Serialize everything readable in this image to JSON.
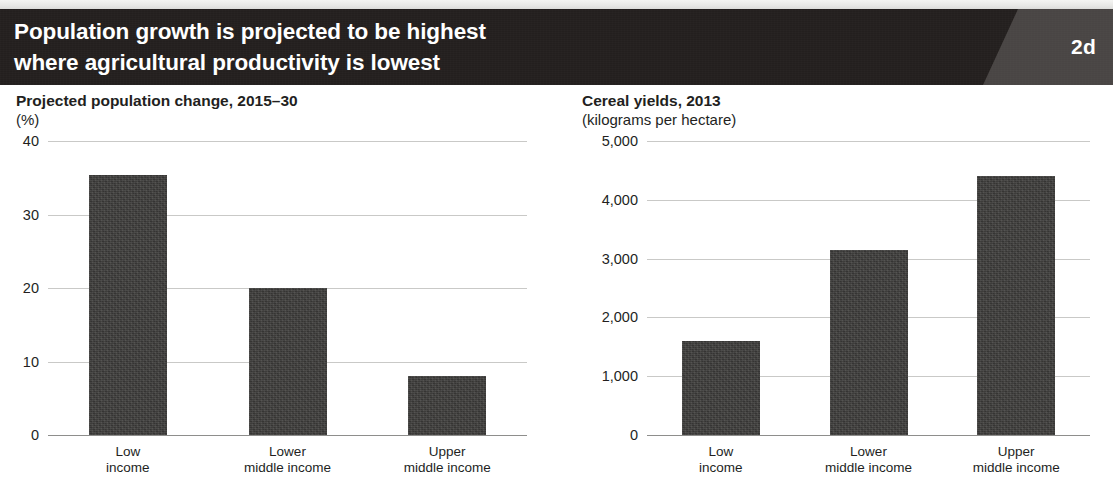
{
  "header": {
    "title_line1": "Population growth is projected to be highest",
    "title_line2": "where agricultural productivity is lowest",
    "badge": "2d",
    "banner_color": "#231f1e",
    "badge_panel_color": "#4a4644",
    "text_color": "#ffffff"
  },
  "theme": {
    "bar_color": "#3d3c3a",
    "gridline_color": "#c9c9c7",
    "axis_color": "#8e8e8c",
    "page_background": "#ffffff",
    "text_color": "#231f1e"
  },
  "chart_data": [
    {
      "id": "projected-population-change",
      "type": "bar",
      "title": "Projected population change, 2015–30",
      "subtitle": "(%)",
      "xlabel": "",
      "ylabel": "(%)",
      "categories": [
        "Low income",
        "Lower middle income",
        "Upper middle income"
      ],
      "category_lines": [
        [
          "Low",
          "income"
        ],
        [
          "Lower",
          "middle income"
        ],
        [
          "Upper",
          "middle income"
        ]
      ],
      "values": [
        35.4,
        20.0,
        8.0
      ],
      "ylim": [
        0,
        40
      ],
      "yticks": [
        0,
        10,
        20,
        30,
        40
      ],
      "ytick_labels": [
        "0",
        "10",
        "20",
        "30",
        "40"
      ],
      "grid": true,
      "legend": "none"
    },
    {
      "id": "cereal-yields",
      "type": "bar",
      "title": "Cereal yields, 2013",
      "subtitle": "(kilograms per hectare)",
      "xlabel": "",
      "ylabel": "(kilograms per hectare)",
      "categories": [
        "Low income",
        "Lower middle income",
        "Upper middle income"
      ],
      "category_lines": [
        [
          "Low",
          "income"
        ],
        [
          "Lower",
          "middle income"
        ],
        [
          "Upper",
          "middle income"
        ]
      ],
      "values": [
        1600,
        3150,
        4400
      ],
      "ylim": [
        0,
        5000
      ],
      "yticks": [
        0,
        1000,
        2000,
        3000,
        4000,
        5000
      ],
      "ytick_labels": [
        "0",
        "1,000",
        "2,000",
        "3,000",
        "4,000",
        "5,000"
      ],
      "grid": true,
      "legend": "none"
    }
  ]
}
